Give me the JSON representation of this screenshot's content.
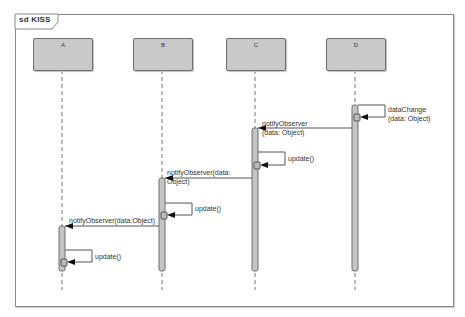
{
  "diagram": {
    "type": "sequence",
    "frame_label": "sd KISS",
    "lifelines": [
      {
        "name": "A",
        "x": 62
      },
      {
        "name": "B",
        "x": 162
      },
      {
        "name": "C",
        "x": 255
      },
      {
        "name": "D",
        "x": 355
      }
    ],
    "messages": [
      {
        "from": "D",
        "to": "D",
        "label": "dataChange\n(data: Object)",
        "kind": "self"
      },
      {
        "from": "D",
        "to": "C",
        "label": "notifyObserver\n(data: Object)",
        "kind": "call"
      },
      {
        "from": "C",
        "to": "C",
        "label": "update()",
        "kind": "self"
      },
      {
        "from": "C",
        "to": "B",
        "label": "notifyObserver(data:\nObject)",
        "kind": "call"
      },
      {
        "from": "B",
        "to": "B",
        "label": "update()",
        "kind": "self"
      },
      {
        "from": "B",
        "to": "A",
        "label": "notifyObserver(data:Object)",
        "kind": "call"
      },
      {
        "from": "A",
        "to": "A",
        "label": "update()",
        "kind": "self"
      }
    ]
  }
}
